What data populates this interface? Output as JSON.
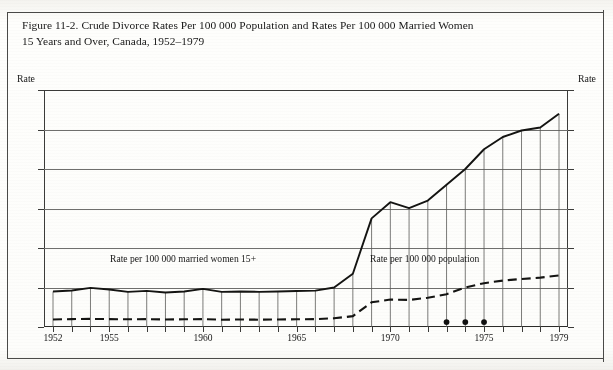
{
  "figure": {
    "title_line1": "Figure 11-2.  Crude Divorce Rates Per 100 000 Population and Rates Per 100 000 Married Women",
    "title_line2": "15 Years and Over, Canada, 1952–1979"
  },
  "axes": {
    "y_axis_title_left": "Rate",
    "y_axis_title_right": "Rate",
    "y_ticks": [
      0,
      200,
      400,
      600,
      800,
      1000,
      1200
    ],
    "y_tick_labels": [
      "0",
      "200",
      "400",
      "600",
      "800",
      "1000",
      "1200"
    ],
    "x_tick_labels": [
      "1952",
      "1955",
      "1960",
      "1965",
      "1970",
      "1975",
      "1979"
    ]
  },
  "annotations": {
    "married_women_label": "Rate per 100 000 married women 15+",
    "population_label": "Rate per 100 000 population"
  },
  "chart_data": {
    "type": "line",
    "title": "Figure 11-2.  Crude Divorce Rates Per 100 000 Population and Rates Per 100 000 Married Women 15 Years and Over, Canada, 1952–1979",
    "xlabel": "",
    "ylabel": "Rate",
    "ylim": [
      0,
      1200
    ],
    "xlim": [
      1952,
      1979
    ],
    "grid": "horizontal",
    "legend": "inline-annotations",
    "x": [
      1952,
      1953,
      1954,
      1955,
      1956,
      1957,
      1958,
      1959,
      1960,
      1961,
      1962,
      1963,
      1964,
      1965,
      1966,
      1967,
      1968,
      1969,
      1970,
      1971,
      1972,
      1973,
      1974,
      1975,
      1976,
      1977,
      1978,
      1979
    ],
    "series": [
      {
        "name": "Rate per 100 000 married women 15+",
        "style": "solid",
        "values": [
          180,
          185,
          198,
          190,
          178,
          183,
          175,
          180,
          193,
          178,
          180,
          178,
          180,
          182,
          184,
          200,
          270,
          550,
          632,
          602,
          640,
          720,
          800,
          900,
          962,
          995,
          1010,
          1080
        ]
      },
      {
        "name": "Rate per 100 000 population",
        "style": "dashed",
        "values": [
          38,
          40,
          41,
          40,
          39,
          40,
          38,
          39,
          40,
          37,
          38,
          37,
          38,
          39,
          40,
          44,
          55,
          125,
          139,
          137,
          148,
          166,
          200,
          222,
          235,
          243,
          250,
          261
        ]
      }
    ],
    "markers": {
      "description": "filled dots near baseline",
      "x": [
        1973,
        1974,
        1975
      ],
      "y": [
        25,
        25,
        25
      ]
    }
  }
}
